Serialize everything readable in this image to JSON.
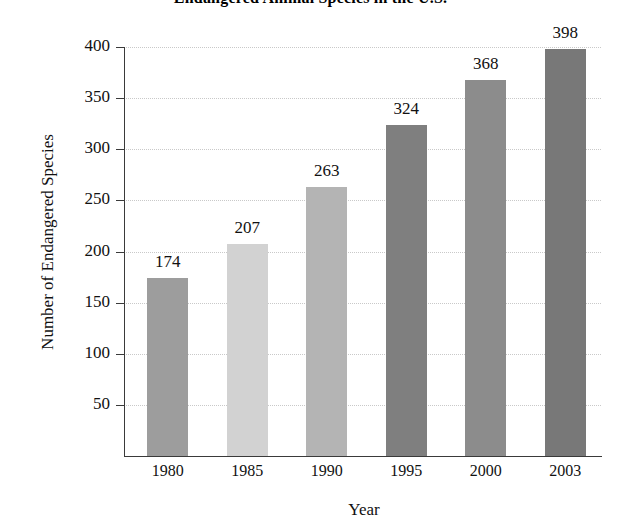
{
  "chart_data": {
    "type": "bar",
    "title": "Endangered Animal Species in the U.S.",
    "xlabel": "Year",
    "ylabel": "Number of Endangered Species",
    "categories": [
      "1980",
      "1985",
      "1990",
      "1995",
      "2000",
      "2003"
    ],
    "values": [
      174,
      207,
      263,
      324,
      368,
      398
    ],
    "value_labels": [
      "174",
      "207",
      "263",
      "324",
      "368",
      "398"
    ],
    "ylim": [
      0,
      400
    ],
    "ytick_values": [
      50,
      100,
      150,
      200,
      250,
      300,
      350,
      400
    ],
    "ytick_labels": [
      "50",
      "100",
      "150",
      "200",
      "250",
      "300",
      "350",
      "400"
    ],
    "grid": "horizontal-dotted",
    "legend": "none",
    "bar_colors": [
      "#9d9d9d",
      "#d2d2d2",
      "#b4b4b4",
      "#7f7f7f",
      "#8c8c8c",
      "#787878"
    ],
    "axis_color": "#3a3a3a",
    "gridline_color": "#c9c9c9"
  }
}
